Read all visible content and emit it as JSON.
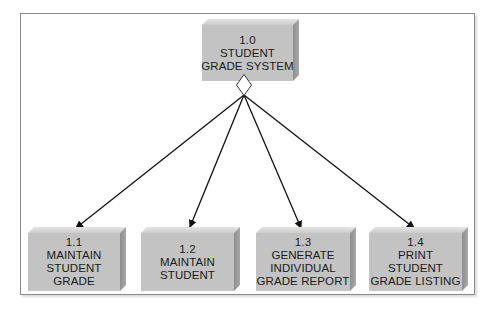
{
  "diagram": {
    "type": "structure-chart",
    "root": {
      "id": "1.0",
      "lines": [
        "1.0",
        "STUDENT",
        "GRADE SYSTEM"
      ]
    },
    "children": [
      {
        "id": "1.1",
        "lines": [
          "1.1",
          "MAINTAIN",
          "STUDENT",
          "GRADE"
        ]
      },
      {
        "id": "1.2",
        "lines": [
          "1.2",
          "MAINTAIN",
          "STUDENT"
        ]
      },
      {
        "id": "1.3",
        "lines": [
          "1.3",
          "GENERATE",
          "INDIVIDUAL",
          "GRADE REPORT"
        ]
      },
      {
        "id": "1.4",
        "lines": [
          "1.4",
          "PRINT",
          "STUDENT",
          "GRADE LISTING"
        ]
      }
    ],
    "connector": "diamond-condition-icon",
    "colors": {
      "box_face": "#c3c3c3",
      "box_side": "#999999",
      "box_top": "#dcdcdc",
      "frame_border": "#8a8a8a",
      "arrow": "#111111"
    }
  }
}
